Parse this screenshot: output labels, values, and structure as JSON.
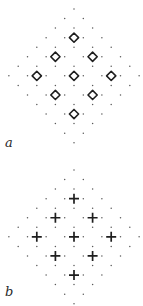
{
  "figure": {
    "colors": {
      "background": "#ffffff",
      "dot": "#5a5a5a",
      "symbol": "#1e1e1e"
    },
    "lattice": {
      "center_x": 74,
      "row_step": 9.55,
      "col_step": 9.3,
      "rows": 15
    },
    "panels": [
      {
        "id": "a",
        "label": "a",
        "label_pos": [
          5,
          136
        ],
        "top_y": 9,
        "symbol": "diamond",
        "symbol_positions": [
          [
            3,
            0
          ],
          [
            5,
            -2
          ],
          [
            5,
            2
          ],
          [
            7,
            -4
          ],
          [
            7,
            0
          ],
          [
            7,
            4
          ],
          [
            9,
            -2
          ],
          [
            9,
            2
          ],
          [
            11,
            0
          ]
        ]
      },
      {
        "id": "b",
        "label": "b",
        "label_pos": [
          5,
          285
        ],
        "top_y": 170,
        "symbol": "cross",
        "symbol_positions": [
          [
            3,
            0
          ],
          [
            5,
            -2
          ],
          [
            5,
            2
          ],
          [
            7,
            -4
          ],
          [
            7,
            0
          ],
          [
            7,
            4
          ],
          [
            9,
            -2
          ],
          [
            9,
            2
          ],
          [
            11,
            0
          ]
        ]
      }
    ]
  }
}
